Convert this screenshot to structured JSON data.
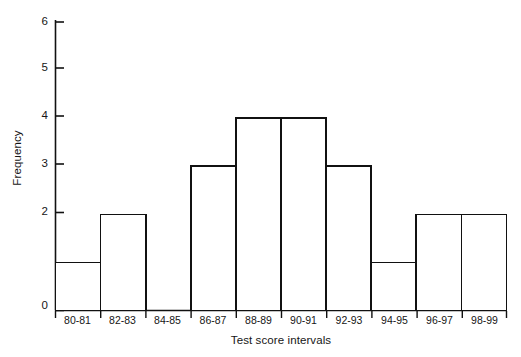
{
  "chart_data": {
    "type": "bar",
    "title": "",
    "xlabel": "Test score intervals",
    "ylabel": "Frequency",
    "categories": [
      "80-81",
      "82-83",
      "84-85",
      "86-87",
      "88-89",
      "90-91",
      "92-93",
      "94-95",
      "96-97",
      "98-99"
    ],
    "values": [
      1,
      2,
      0,
      3,
      4,
      4,
      3,
      1,
      2,
      2
    ],
    "ylim": [
      0,
      6
    ],
    "yticks": [
      0,
      1,
      2,
      3,
      4,
      5,
      6
    ],
    "ytick_labels": [
      "0",
      "1",
      "2",
      "3",
      "4",
      "5",
      "6"
    ],
    "grid": false,
    "legend": null,
    "style": {
      "bar_fill": "#ffffff",
      "bar_edge": "#111111",
      "axis_color": "#111111",
      "background": "#ffffff",
      "bar_edge_width": 1.6
    }
  },
  "axes": {
    "y_tick_0": "0",
    "y_tick_1": "1",
    "y_tick_2": "2",
    "y_tick_3": "3",
    "y_tick_4": "4",
    "y_tick_5": "5",
    "y_tick_6": "6"
  }
}
